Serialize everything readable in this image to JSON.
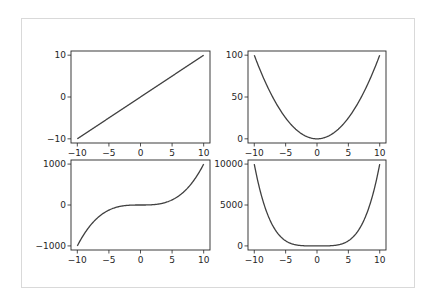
{
  "figure": {
    "layout": "2x2 subplot grid",
    "frame_color": "#d9d9d9",
    "line_color": "#404040",
    "axis_color": "#262626"
  },
  "chart_data": [
    {
      "type": "line",
      "title": "",
      "function": "y = x",
      "xlabel": "",
      "ylabel": "",
      "xlim": [
        -11,
        11
      ],
      "ylim": [
        -11,
        11
      ],
      "xticks": [
        -10,
        -5,
        0,
        5,
        10
      ],
      "xtick_labels": [
        "−10",
        "−5",
        "0",
        "5",
        "10"
      ],
      "yticks": [
        -10,
        0,
        10
      ],
      "ytick_labels": [
        "−10",
        "0",
        "10"
      ],
      "x": [
        -10,
        -5,
        0,
        5,
        10
      ],
      "y": [
        -10,
        -5,
        0,
        5,
        10
      ],
      "grid": false
    },
    {
      "type": "line",
      "title": "",
      "function": "y = x^2",
      "xlabel": "",
      "ylabel": "",
      "xlim": [
        -11,
        11
      ],
      "ylim": [
        -5,
        105
      ],
      "xticks": [
        -10,
        -5,
        0,
        5,
        10
      ],
      "xtick_labels": [
        "−10",
        "−5",
        "0",
        "5",
        "10"
      ],
      "yticks": [
        0,
        50,
        100
      ],
      "ytick_labels": [
        "0",
        "50",
        "100"
      ],
      "x": [
        -10,
        -5,
        0,
        5,
        10
      ],
      "y": [
        100,
        25,
        0,
        25,
        100
      ],
      "grid": false
    },
    {
      "type": "line",
      "title": "",
      "function": "y = x^3",
      "xlabel": "",
      "ylabel": "",
      "xlim": [
        -11,
        11
      ],
      "ylim": [
        -1100,
        1100
      ],
      "xticks": [
        -10,
        -5,
        0,
        5,
        10
      ],
      "xtick_labels": [
        "−10",
        "−5",
        "0",
        "5",
        "10"
      ],
      "yticks": [
        -1000,
        0,
        1000
      ],
      "ytick_labels": [
        "−1000",
        "0",
        "1000"
      ],
      "x": [
        -10,
        -5,
        0,
        5,
        10
      ],
      "y": [
        -1000,
        -125,
        0,
        125,
        1000
      ],
      "grid": false
    },
    {
      "type": "line",
      "title": "",
      "function": "y = x^4",
      "xlabel": "",
      "ylabel": "",
      "xlim": [
        -11,
        11
      ],
      "ylim": [
        -500,
        10500
      ],
      "xticks": [
        -10,
        -5,
        0,
        5,
        10
      ],
      "xtick_labels": [
        "−10",
        "−5",
        "0",
        "5",
        "10"
      ],
      "yticks": [
        0,
        5000,
        10000
      ],
      "ytick_labels": [
        "0",
        "5000",
        "10000"
      ],
      "x": [
        -10,
        -5,
        0,
        5,
        10
      ],
      "y": [
        10000,
        625,
        0,
        625,
        10000
      ],
      "grid": false
    }
  ]
}
